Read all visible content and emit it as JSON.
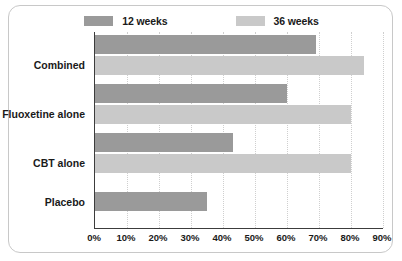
{
  "chart_data": {
    "type": "bar",
    "orientation": "horizontal",
    "title": "",
    "xlabel": "",
    "ylabel": "",
    "categories": [
      "Combined",
      "Fluoxetine alone",
      "CBT alone",
      "Placebo"
    ],
    "series": [
      {
        "name": "12 weeks",
        "color": "#9a9a9a",
        "values": [
          69,
          60,
          43,
          35
        ]
      },
      {
        "name": "36 weeks",
        "color": "#c9c9c9",
        "values": [
          84,
          80,
          80,
          null
        ]
      }
    ],
    "xlim": [
      0,
      90
    ],
    "xticks": [
      0,
      10,
      20,
      30,
      40,
      50,
      60,
      70,
      80,
      90
    ],
    "xtick_labels": [
      "0%",
      "10%",
      "20%",
      "30%",
      "40%",
      "50%",
      "60%",
      "70%",
      "80%",
      "90%"
    ],
    "grid": true,
    "grid_axis": "x",
    "grid_style": "dotted",
    "legend_position": "top-center",
    "value_format": "percent"
  },
  "legend": {
    "entries": [
      {
        "label": "12 weeks",
        "color": "#9a9a9a"
      },
      {
        "label": "36 weeks",
        "color": "#c9c9c9"
      }
    ]
  },
  "axis": {
    "tick_labels": [
      "0%",
      "10%",
      "20%",
      "30%",
      "40%",
      "50%",
      "60%",
      "70%",
      "80%",
      "90%"
    ]
  },
  "categories": [
    "Combined",
    "Fluoxetine alone",
    "CBT alone",
    "Placebo"
  ],
  "colors": {
    "series_12_weeks": "#9a9a9a",
    "series_36_weeks": "#c9c9c9",
    "axis": "#3c3c3c",
    "gridline": "#cfcfcf",
    "frame_border": "#c8c8c8",
    "text": "#1a1a1a",
    "background": "#ffffff"
  }
}
